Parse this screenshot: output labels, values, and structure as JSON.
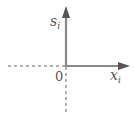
{
  "diagram": {
    "y_axis_label": "s",
    "y_axis_subscript": "i",
    "x_axis_label": "x",
    "x_axis_subscript": "i",
    "origin_label": "0",
    "axis_color": "#888888",
    "dashed_color": "#666666"
  }
}
